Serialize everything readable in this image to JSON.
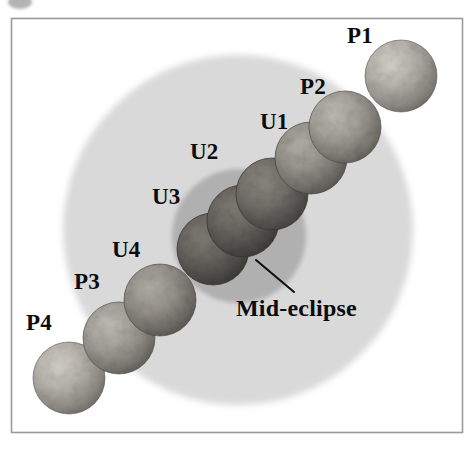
{
  "figure": {
    "title_text": "",
    "kind": "lunar-eclipse-contact-diagram",
    "frame": {
      "border_color": "#9a9a9a",
      "background": "#ffffff",
      "x": 11,
      "y": 18,
      "width": 452,
      "height": 415
    },
    "corner_mark": {
      "name": "cut-off-bullet-mark",
      "color": "#b3b3b3",
      "cx": 20,
      "cy": 2,
      "rx": 12,
      "ry": 7
    },
    "shadows": [
      {
        "id": "penumbra",
        "label": "penumbra",
        "color": "#d9d9d9",
        "cx": 238,
        "cy": 230,
        "r": 175
      },
      {
        "id": "umbra",
        "label": "umbra",
        "color": "#b0b0b0",
        "cx": 239,
        "cy": 236,
        "r": 67
      }
    ],
    "moons": [
      {
        "id": "P1",
        "cx": 401,
        "cy": 76,
        "r": 36,
        "tone": "bright",
        "base": "#b9b5ae",
        "shade": "#6f6c66"
      },
      {
        "id": "P2",
        "cx": 345,
        "cy": 127,
        "r": 36,
        "tone": "light-dim",
        "base": "#a7a39c",
        "shade": "#605d58"
      },
      {
        "id": "U1",
        "cx": 311,
        "cy": 158,
        "r": 36,
        "tone": "dim",
        "base": "#9a968f",
        "shade": "#57544f"
      },
      {
        "id": "U2",
        "cx": 272,
        "cy": 194,
        "r": 36,
        "tone": "dark",
        "base": "#77736d",
        "shade": "#403e3a"
      },
      {
        "id": "U3",
        "cx": 243,
        "cy": 221,
        "r": 36,
        "tone": "darkest",
        "base": "#6b6761",
        "shade": "#3a3835"
      },
      {
        "id": "U4",
        "cx": 213,
        "cy": 249,
        "r": 36,
        "tone": "darkest",
        "base": "#6b6761",
        "shade": "#3a3835"
      },
      {
        "id": "P3",
        "cx": 160,
        "cy": 300,
        "r": 36,
        "tone": "dim",
        "base": "#9c9891",
        "shade": "#595651"
      },
      {
        "id": "P4",
        "cx": 119,
        "cy": 338,
        "r": 36,
        "tone": "light-dim",
        "base": "#a9a59e",
        "shade": "#615e58"
      },
      {
        "id": "P4b",
        "cx": 69,
        "cy": 378,
        "r": 36,
        "tone": "bright",
        "base": "#b9b5ae",
        "shade": "#6f6c66"
      }
    ],
    "labels": [
      {
        "id": "P1",
        "text": "P1",
        "x": 347,
        "y": 24,
        "kind": "phase"
      },
      {
        "id": "P2",
        "text": "P2",
        "x": 300,
        "y": 75,
        "kind": "phase"
      },
      {
        "id": "U1",
        "text": "U1",
        "x": 260,
        "y": 110,
        "kind": "phase"
      },
      {
        "id": "U2",
        "text": "U2",
        "x": 190,
        "y": 140,
        "kind": "phase"
      },
      {
        "id": "U3",
        "text": "U3",
        "x": 152,
        "y": 185,
        "kind": "phase"
      },
      {
        "id": "U4",
        "text": "U4",
        "x": 112,
        "y": 238,
        "kind": "phase"
      },
      {
        "id": "P3",
        "text": "P3",
        "x": 74,
        "y": 270,
        "kind": "phase"
      },
      {
        "id": "P4",
        "text": "P4",
        "x": 26,
        "y": 311,
        "kind": "phase"
      },
      {
        "id": "MID",
        "text": "Mid-eclipse",
        "x": 236,
        "y": 296,
        "kind": "mid"
      }
    ],
    "leader_line": {
      "name": "mid-eclipse-leader-line",
      "color": "#111111",
      "x1": 256,
      "y1": 260,
      "x2": 294,
      "y2": 292
    }
  }
}
